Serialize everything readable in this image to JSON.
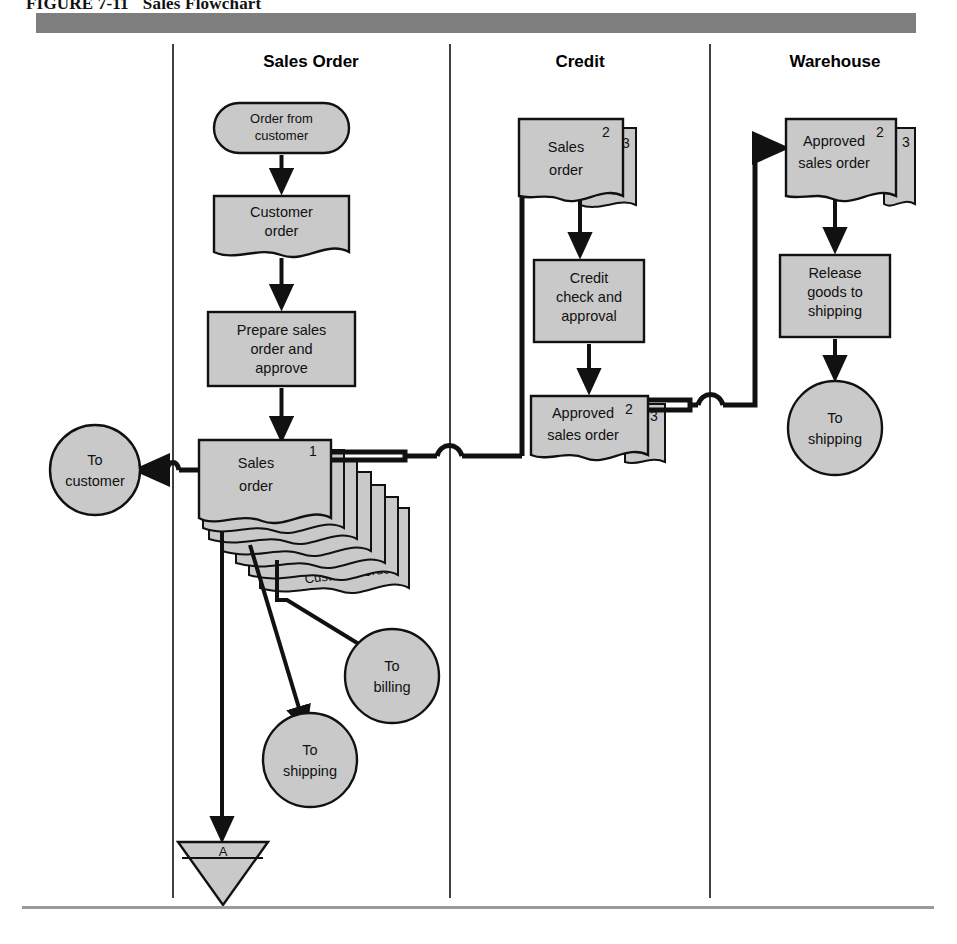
{
  "figure": {
    "number": "FIGURE 7-11",
    "title": "Sales Flowchart"
  },
  "columns": [
    {
      "key": "sales_order",
      "label": "Sales Order",
      "center_x": 311
    },
    {
      "key": "credit",
      "label": "Credit",
      "center_x": 580
    },
    {
      "key": "warehouse",
      "label": "Warehouse",
      "center_x": 833
    }
  ],
  "colors": {
    "shape_fill": "#c9c9c9",
    "shape_stroke": "#111111",
    "header_bar": "#7e7e7e",
    "bottom_rule": "#9a9a9a",
    "page_background": "#ffffff"
  },
  "nodes": {
    "order_from_customer": {
      "type": "terminal",
      "line1": "Order from",
      "line2": "customer"
    },
    "customer_order_doc": {
      "type": "document",
      "line1": "Customer",
      "line2": "order"
    },
    "prepare_sales_order": {
      "type": "process",
      "line1": "Prepare sales",
      "line2": "order and",
      "line3": "approve"
    },
    "sales_order_stack": {
      "type": "document-stack",
      "line1": "Sales",
      "line2": "order",
      "copies": [
        "1",
        "2",
        "3",
        "4",
        "5",
        "6"
      ],
      "back_label": "Customer order"
    },
    "to_customer": {
      "type": "connector-circle",
      "line1": "To",
      "line2": "customer"
    },
    "to_billing": {
      "type": "connector-circle",
      "line1": "To",
      "line2": "billing"
    },
    "to_shipping_sales": {
      "type": "connector-circle",
      "line1": "To",
      "line2": "shipping"
    },
    "file_a": {
      "type": "file-triangle",
      "label": "A"
    },
    "credit_sales_order": {
      "type": "document-stack",
      "line1": "Sales",
      "line2": "order",
      "copies": [
        "2",
        "3"
      ]
    },
    "credit_check": {
      "type": "process",
      "line1": "Credit",
      "line2": "check and",
      "line3": "approval"
    },
    "credit_approved_so": {
      "type": "document-stack",
      "line1": "Approved",
      "line2": "sales order",
      "copies": [
        "2",
        "3"
      ]
    },
    "wh_approved_so": {
      "type": "document-stack",
      "line1": "Approved",
      "line2": "sales order",
      "copies": [
        "2",
        "3"
      ]
    },
    "release_goods": {
      "type": "process",
      "line1": "Release",
      "line2": "goods to",
      "line3": "shipping"
    },
    "to_shipping_wh": {
      "type": "connector-circle",
      "line1": "To",
      "line2": "shipping"
    }
  }
}
